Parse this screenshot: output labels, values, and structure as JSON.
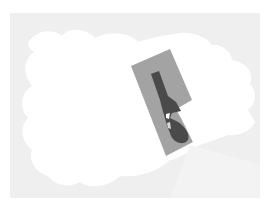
{
  "image": {
    "description": "Grayscale photo-like image: a tilted gray rectangular card with a dark silhouette, over a light gray textured background partly covered by a white irregular blob",
    "colors": {
      "page_bg": "#ffffff",
      "background_field": "#efefef",
      "white_blob": "#ffffff",
      "card": "#a3a3a3",
      "silhouette": "#4a4a4a"
    }
  }
}
